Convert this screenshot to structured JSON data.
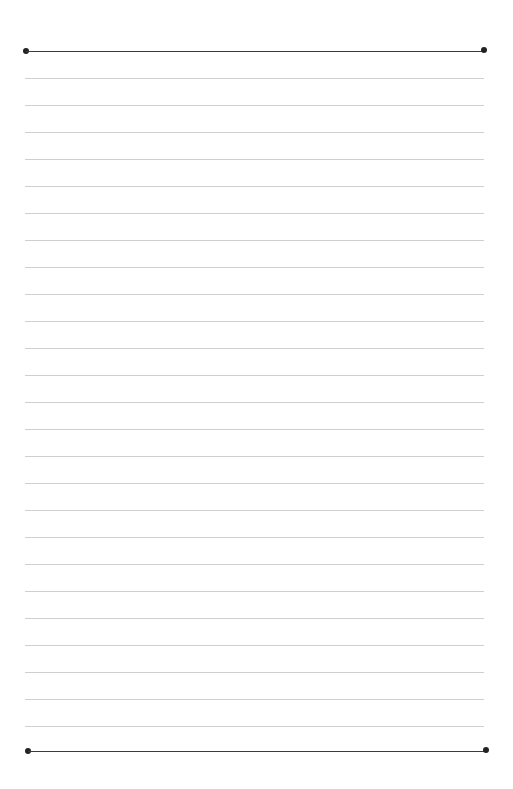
{
  "document": {
    "type": "lined-paper",
    "colors": {
      "background": "#ffffff",
      "heavy_rule": "#3a3a3a",
      "light_rule": "#cfcfcf",
      "dot": "#222222"
    },
    "top_rule": {
      "y": 51,
      "x_start": 26,
      "x_end": 484
    },
    "bottom_rule": {
      "y": 751,
      "x_start": 28,
      "x_end": 486
    },
    "ruled_lines": {
      "count": 25,
      "first_y": 78,
      "spacing": 27
    }
  }
}
